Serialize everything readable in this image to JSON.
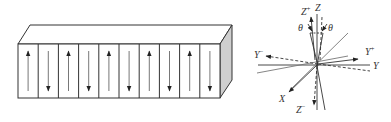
{
  "figure": {
    "left_panel": {
      "title": "Periodically poled domain bar",
      "domain_count": 10,
      "arrow_directions": [
        "up",
        "down",
        "up",
        "down",
        "up",
        "down",
        "up",
        "down",
        "up",
        "down"
      ],
      "face_color": "#ffffff",
      "side_color": "#cfcfcf",
      "line_color": "#333333"
    },
    "right_panel": {
      "axes_labels": {
        "z_plus": "Z",
        "z_plus_sup": "+",
        "z": "Z",
        "theta_left": "θ",
        "theta_right": "θ",
        "y_minus": "Y",
        "y_minus_sup": "−",
        "y_plus": "Y",
        "y_plus_sup": "+",
        "y": "Y",
        "x": "X",
        "z_minus": "Z",
        "z_minus_sup": "−"
      },
      "line_color": "#333333"
    }
  }
}
